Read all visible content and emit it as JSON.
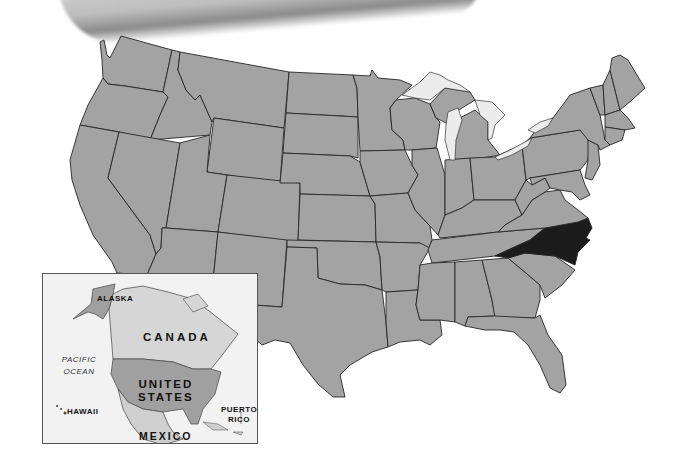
{
  "map": {
    "title": "",
    "highlighted_state": "North Carolina",
    "colors": {
      "state_fill": "#a3a3a3",
      "highlight_fill": "#1c1c1c",
      "border": "#262626",
      "lake_fill": "#ececec",
      "background": "#ffffff"
    }
  },
  "inset": {
    "labels": {
      "alaska": "ALASKA",
      "canada": "CANADA",
      "pacific": "PACIFIC",
      "ocean": "OCEAN",
      "united": "UNITED",
      "states": "STATES",
      "hawaii": "HAWAII",
      "puerto": "PUERTO",
      "rico": "RICO",
      "mexico": "MEXICO"
    },
    "colors": {
      "background": "#f2f2f2",
      "us_fill": "#a0a0a0",
      "canada_fill": "#d6d6d6",
      "mexico_fill": "#cfcfcf",
      "border": "#555555"
    }
  }
}
